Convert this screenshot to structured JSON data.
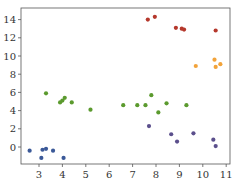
{
  "chart_data": {
    "type": "scatter",
    "title": "",
    "xlabel": "",
    "ylabel": "",
    "xlim": [
      2.3,
      11.2
    ],
    "ylim": [
      -1.9,
      15.2
    ],
    "grid": false,
    "legend": null,
    "x_ticks": [
      "3",
      "4",
      "5",
      "6",
      "7",
      "8",
      "9",
      "10",
      "11"
    ],
    "y_ticks": [
      "0",
      "2",
      "4",
      "6",
      "8",
      "10",
      "12",
      "14"
    ],
    "series": [
      {
        "name": "blue",
        "color": "#3b5998",
        "points": [
          [
            2.6,
            -0.4
          ],
          [
            3.1,
            -1.2
          ],
          [
            3.15,
            -0.3
          ],
          [
            3.3,
            -0.2
          ],
          [
            3.6,
            -0.4
          ],
          [
            4.05,
            -1.2
          ]
        ]
      },
      {
        "name": "green",
        "color": "#5b9a2e",
        "points": [
          [
            3.3,
            5.9
          ],
          [
            3.9,
            4.9
          ],
          [
            4.0,
            5.1
          ],
          [
            4.1,
            5.4
          ],
          [
            4.4,
            4.9
          ],
          [
            5.2,
            4.1
          ],
          [
            6.6,
            4.6
          ],
          [
            7.2,
            4.6
          ],
          [
            7.55,
            4.6
          ],
          [
            7.8,
            5.7
          ],
          [
            8.1,
            3.8
          ],
          [
            8.45,
            4.8
          ],
          [
            9.3,
            4.6
          ]
        ]
      },
      {
        "name": "purple",
        "color": "#5b4f8c",
        "points": [
          [
            7.7,
            2.3
          ],
          [
            8.65,
            1.4
          ],
          [
            8.9,
            0.6
          ],
          [
            9.6,
            1.5
          ],
          [
            10.45,
            0.8
          ],
          [
            10.55,
            0.1
          ]
        ]
      },
      {
        "name": "red",
        "color": "#b5382c",
        "points": [
          [
            7.65,
            14.0
          ],
          [
            7.95,
            14.3
          ],
          [
            8.85,
            13.1
          ],
          [
            9.1,
            13.0
          ],
          [
            9.2,
            12.9
          ],
          [
            10.55,
            12.8
          ]
        ]
      },
      {
        "name": "orange",
        "color": "#f2a33a",
        "points": [
          [
            9.7,
            8.9
          ],
          [
            10.5,
            9.6
          ],
          [
            10.55,
            8.8
          ],
          [
            10.75,
            9.1
          ]
        ]
      }
    ]
  }
}
